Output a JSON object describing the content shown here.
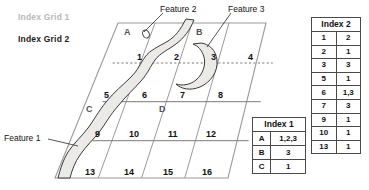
{
  "legends": {
    "grid1": "Index Grid 1",
    "grid2": "Index Grid 2"
  },
  "callouts": {
    "feature1": "Feature 1",
    "feature2": "Feature 2",
    "feature3": "Feature 3"
  },
  "grid": {
    "letters": [
      "A",
      "B",
      "C",
      "D"
    ],
    "numbers": [
      "1",
      "2",
      "3",
      "4",
      "5",
      "6",
      "7",
      "8",
      "9",
      "10",
      "11",
      "12",
      "13",
      "14",
      "15",
      "16"
    ]
  },
  "index1": {
    "title": "Index 1",
    "rows": [
      {
        "key": "A",
        "value": "1,2,3"
      },
      {
        "key": "B",
        "value": "3"
      },
      {
        "key": "C",
        "value": "1"
      }
    ]
  },
  "index2": {
    "title": "Index 2",
    "rows": [
      {
        "key": "1",
        "value": "2"
      },
      {
        "key": "2",
        "value": "1"
      },
      {
        "key": "3",
        "value": "3"
      },
      {
        "key": "5",
        "value": "1"
      },
      {
        "key": "6",
        "value": "1,3"
      },
      {
        "key": "7",
        "value": "3"
      },
      {
        "key": "9",
        "value": "1"
      },
      {
        "key": "10",
        "value": "1"
      },
      {
        "key": "13",
        "value": "1"
      }
    ]
  },
  "colors": {
    "grid_line": "#9a9a9a",
    "row_line": "#7a7a7a",
    "dashed_line": "#7a7a7a",
    "feature_fill": "#eceae7",
    "feature_stroke": "#3a3a3a",
    "legend_muted": "#b9b9b9"
  }
}
